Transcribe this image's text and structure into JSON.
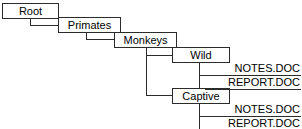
{
  "diagram": {
    "width": 302,
    "height": 129,
    "line_color": "#2b2b2b",
    "background": "#ffffff",
    "text_color": "#000000"
  },
  "nodes": [
    {
      "id": "root",
      "label": "Root",
      "x": 2,
      "y": 3,
      "w": 57,
      "h": 16,
      "level": 0
    },
    {
      "id": "primates",
      "label": "Primates",
      "x": 58,
      "y": 17,
      "w": 63,
      "h": 16,
      "level": 1
    },
    {
      "id": "monkeys",
      "label": "Monkeys",
      "x": 114,
      "y": 32,
      "w": 63,
      "h": 16,
      "level": 2
    },
    {
      "id": "wild",
      "label": "Wild",
      "x": 172,
      "y": 47,
      "w": 58,
      "h": 16,
      "level": 3
    },
    {
      "id": "captive",
      "label": "Captive",
      "x": 172,
      "y": 88,
      "w": 58,
      "h": 16,
      "level": 3
    }
  ],
  "files": [
    {
      "id": "wild-notes",
      "label": "NOTES.DOC",
      "parent": "wild",
      "x": 205,
      "y": 62,
      "w": 96,
      "h": 14
    },
    {
      "id": "wild-report",
      "label": "REPORT.DOC",
      "parent": "wild",
      "x": 205,
      "y": 76,
      "w": 96,
      "h": 14
    },
    {
      "id": "captive-notes",
      "label": "NOTES.DOC",
      "parent": "captive",
      "x": 205,
      "y": 103,
      "w": 96,
      "h": 14
    },
    {
      "id": "captive-report",
      "label": "REPORT.DOC",
      "parent": "captive",
      "x": 205,
      "y": 117,
      "w": 96,
      "h": 14
    }
  ],
  "connectors": [
    {
      "id": "root-down",
      "orient": "v",
      "x": 30,
      "y": 19,
      "len": 7
    },
    {
      "id": "root-to-primates",
      "orient": "h",
      "x": 30,
      "y": 25,
      "len": 29
    },
    {
      "id": "primates-down",
      "orient": "v",
      "x": 86,
      "y": 33,
      "len": 7
    },
    {
      "id": "primates-to-monkeys",
      "orient": "h",
      "x": 86,
      "y": 39,
      "len": 29
    },
    {
      "id": "monkeys-down",
      "orient": "v",
      "x": 146,
      "y": 48,
      "len": 48
    },
    {
      "id": "monkeys-to-wild",
      "orient": "h",
      "x": 146,
      "y": 55,
      "len": 27
    },
    {
      "id": "monkeys-to-captive",
      "orient": "h",
      "x": 146,
      "y": 95,
      "len": 27
    },
    {
      "id": "wild-down",
      "orient": "v",
      "x": 199,
      "y": 63,
      "len": 27
    },
    {
      "id": "wild-to-notes",
      "orient": "h",
      "x": 199,
      "y": 75,
      "len": 7
    },
    {
      "id": "wild-to-report",
      "orient": "h",
      "x": 199,
      "y": 89,
      "len": 7
    },
    {
      "id": "captive-down",
      "orient": "v",
      "x": 199,
      "y": 104,
      "len": 26
    },
    {
      "id": "captive-to-notes",
      "orient": "h",
      "x": 199,
      "y": 116,
      "len": 7
    },
    {
      "id": "captive-to-report",
      "orient": "h",
      "x": 199,
      "y": 129,
      "len": 7
    }
  ]
}
